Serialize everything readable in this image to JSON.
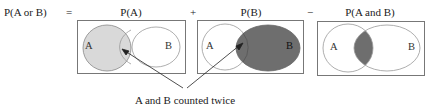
{
  "equation": {
    "lhs": "P(A or B)",
    "equals": "=",
    "plus": "+",
    "minus": "−"
  },
  "panels": [
    {
      "title": "P(A)",
      "set_a_label": "A",
      "set_b_label": "B",
      "shaded": "A"
    },
    {
      "title": "P(B)",
      "set_a_label": "A",
      "set_b_label": "B",
      "shaded": "B"
    },
    {
      "title": "P(A and B)",
      "set_a_label": "A",
      "set_b_label": "B",
      "shaded": "A and B"
    }
  ],
  "annotation": "A and B counted twice",
  "colors": {
    "light_shade": "#d9d9d9",
    "dark_shade": "#6e6e6e",
    "outline": "#8c8c8c",
    "box": "#777777"
  }
}
